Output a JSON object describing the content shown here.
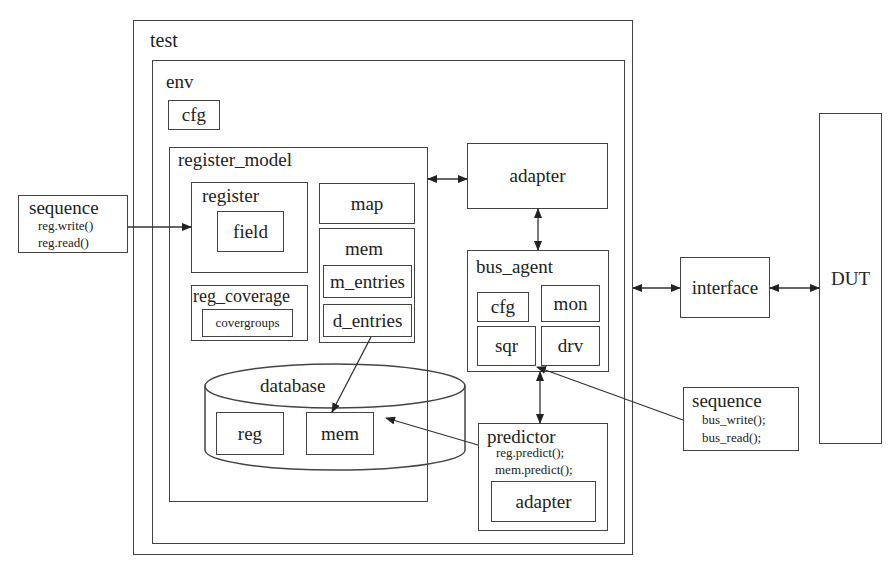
{
  "diagram": {
    "test": {
      "label": "test"
    },
    "env": {
      "label": "env",
      "cfg": "cfg"
    },
    "register_model": {
      "label": "register_model",
      "register": {
        "label": "register",
        "field": "field"
      },
      "map": "map",
      "mem": {
        "label": "mem",
        "m_entries": "m_entries",
        "d_entries": "d_entries"
      },
      "reg_coverage": {
        "label": "reg_coverage",
        "covergroups": "covergroups"
      }
    },
    "database": {
      "label": "database",
      "reg": "reg",
      "mem": "mem"
    },
    "adapter": {
      "label": "adapter"
    },
    "bus_agent": {
      "label": "bus_agent",
      "cfg": "cfg",
      "mon": "mon",
      "sqr": "sqr",
      "drv": "drv"
    },
    "predictor": {
      "label": "predictor",
      "line1": "reg.predict();",
      "line2": "mem.predict();",
      "adapter": "adapter"
    },
    "seq_left": {
      "label": "sequence",
      "line1": "reg.write()",
      "line2": "reg.read()"
    },
    "seq_right": {
      "label": "sequence",
      "line1": "bus_write();",
      "line2": "bus_read();"
    },
    "interface": {
      "label": "interface"
    },
    "dut": {
      "label": "DUT"
    },
    "connections": [
      {
        "from": "sequence(reg)",
        "to": "register",
        "type": "arrow"
      },
      {
        "from": "register_model",
        "to": "adapter",
        "type": "bidirectional"
      },
      {
        "from": "adapter",
        "to": "bus_agent",
        "type": "bidirectional"
      },
      {
        "from": "bus_agent",
        "to": "predictor",
        "type": "bidirectional"
      },
      {
        "from": "test",
        "to": "interface",
        "type": "bidirectional"
      },
      {
        "from": "interface",
        "to": "DUT",
        "type": "bidirectional"
      },
      {
        "from": "d_entries",
        "to": "database.mem",
        "type": "arrow"
      },
      {
        "from": "predictor",
        "to": "database",
        "type": "arrow"
      },
      {
        "from": "sequence(bus)",
        "to": "sqr",
        "type": "arrow"
      }
    ]
  }
}
